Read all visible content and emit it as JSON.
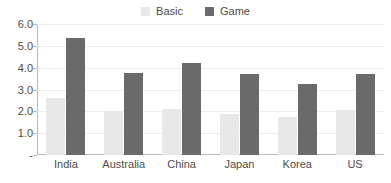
{
  "chart_data": {
    "type": "bar",
    "title": "",
    "subtitle": "",
    "xlabel": "",
    "ylabel": "",
    "categories": [
      "India",
      "Australia",
      "China",
      "Japan",
      "Korea",
      "US"
    ],
    "series": [
      {
        "name": "Basic",
        "color": "#e8e8e8",
        "values": [
          2.6,
          2.0,
          2.1,
          1.9,
          1.75,
          2.05
        ]
      },
      {
        "name": "Game",
        "color": "#6a6a6a",
        "values": [
          5.35,
          3.77,
          4.2,
          3.7,
          3.25,
          3.73
        ]
      }
    ],
    "ylim": [
      0,
      6
    ],
    "yticks": [
      6.0,
      5.0,
      4.0,
      3.0,
      2.0,
      1.0,
      0
    ],
    "ytick_labels": [
      "6.0",
      "5.0",
      "4.0",
      "3.0",
      "2.0",
      "1.0",
      "-"
    ],
    "grid": true,
    "legend_position": "top-center",
    "grid_color": "#ededed",
    "axis_color": "#b9b9b9",
    "text_color": "#4d4d4d",
    "background": "#ffffff"
  },
  "legend": {
    "items": [
      {
        "label": "Basic",
        "swatch_color": "#e8e8e8",
        "icon": "square-swatch-icon"
      },
      {
        "label": "Game",
        "swatch_color": "#6a6a6a",
        "icon": "square-swatch-icon"
      }
    ]
  }
}
